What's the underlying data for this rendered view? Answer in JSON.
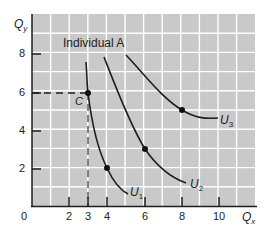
{
  "chart_data": {
    "type": "line",
    "title": "Individual A",
    "xlabel": "Q_x",
    "ylabel": "Q_y",
    "xlim": [
      0,
      12
    ],
    "ylim": [
      0,
      10
    ],
    "grid": true,
    "x_ticks": [
      2,
      3,
      4,
      6,
      8,
      10
    ],
    "y_ticks": [
      2,
      4,
      6,
      8
    ],
    "origin_label": "0",
    "series": [
      {
        "name": "U1",
        "points": [
          [
            2.9,
            7.6
          ],
          [
            3,
            6
          ],
          [
            3.3,
            4.5
          ],
          [
            4,
            2
          ],
          [
            5,
            0.9
          ],
          [
            5.3,
            0.75
          ]
        ],
        "marked_points": [
          [
            3,
            6
          ],
          [
            4,
            2
          ]
        ]
      },
      {
        "name": "U2",
        "points": [
          [
            3.8,
            7.9
          ],
          [
            5,
            5
          ],
          [
            6,
            3
          ],
          [
            7,
            1.9
          ],
          [
            8.1,
            1.2
          ]
        ],
        "marked_points": [
          [
            6,
            3
          ]
        ]
      },
      {
        "name": "U3",
        "points": [
          [
            5,
            8
          ],
          [
            6.5,
            6.3
          ],
          [
            8,
            5
          ],
          [
            9,
            4.6
          ],
          [
            10,
            4.6
          ]
        ],
        "marked_points": [
          [
            8,
            5
          ]
        ]
      }
    ],
    "annotations": [
      {
        "text": "C",
        "x": 3,
        "y": 6,
        "note": "point on U1 with dashed reference lines to axes"
      }
    ]
  },
  "labels": {
    "title": "Individual A",
    "y_axis": "Q",
    "y_axis_sub": "y",
    "x_axis": "Q",
    "x_axis_sub": "x",
    "origin": "0",
    "point_c": "C",
    "u1": "U",
    "u1_sub": "1",
    "u2": "U",
    "u2_sub": "2",
    "u3": "U",
    "u3_sub": "3",
    "xt2": "2",
    "xt3": "3",
    "xt4": "4",
    "xt6": "6",
    "xt8": "8",
    "xt10": "10",
    "yt2": "2",
    "yt4": "4",
    "yt6": "6",
    "yt8": "8"
  },
  "colors": {
    "plot_bg": "#c9c9c9",
    "grid": "#ffffff",
    "curve": "#1e1e1e",
    "text": "#222222"
  }
}
